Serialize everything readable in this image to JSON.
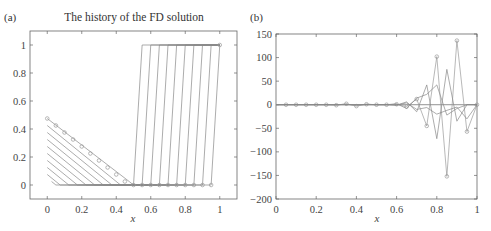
{
  "chart_data": [
    {
      "panel": "(a)",
      "type": "line",
      "title": "The history of the FD solution",
      "xlabel": "x",
      "ylabel": "",
      "xlim": [
        -0.1,
        1.1
      ],
      "ylim": [
        -0.1,
        1.1
      ],
      "xticks": [
        0,
        0.2,
        0.4,
        0.6,
        0.8,
        1
      ],
      "xtick_labels": [
        "0",
        "0.2",
        "0.4",
        "0.6",
        "0.8",
        "1"
      ],
      "yticks": [
        0,
        0.2,
        0.4,
        0.6,
        0.8,
        1
      ],
      "ytick_labels": [
        "0",
        "0.2",
        "0.4",
        "0.6",
        "0.8",
        "1"
      ],
      "grid": false,
      "description": "Ten time levels of a finite-difference solution; a triangular profile decaying from ~0.475 at x=0 to 0 at x=0.5, and a step from 0 to 1 moving left from x=0.95 to x=0.5",
      "series": [
        {
          "name": "step-1",
          "x": [
            0,
            0.475,
            0.5,
            0.95,
            1.0
          ],
          "y": [
            0.475,
            0.025,
            0,
            0,
            1
          ]
        },
        {
          "name": "step-2",
          "x": [
            0,
            0.425,
            0.5,
            0.9,
            0.95,
            1.0
          ],
          "y": [
            0.425,
            0,
            0,
            0,
            1,
            1
          ]
        },
        {
          "name": "step-3",
          "x": [
            0,
            0.375,
            0.5,
            0.85,
            0.9,
            1.0
          ],
          "y": [
            0.375,
            0,
            0,
            0,
            1,
            1
          ]
        },
        {
          "name": "step-4",
          "x": [
            0,
            0.325,
            0.5,
            0.8,
            0.85,
            1.0
          ],
          "y": [
            0.325,
            0,
            0,
            0,
            1,
            1
          ]
        },
        {
          "name": "step-5",
          "x": [
            0,
            0.275,
            0.5,
            0.75,
            0.8,
            1.0
          ],
          "y": [
            0.275,
            0,
            0,
            0,
            1,
            1
          ]
        },
        {
          "name": "step-6",
          "x": [
            0,
            0.225,
            0.5,
            0.7,
            0.75,
            1.0
          ],
          "y": [
            0.225,
            0,
            0,
            0,
            1,
            1
          ]
        },
        {
          "name": "step-7",
          "x": [
            0,
            0.175,
            0.5,
            0.65,
            0.7,
            1.0
          ],
          "y": [
            0.175,
            0,
            0,
            0,
            1,
            1
          ]
        },
        {
          "name": "step-8",
          "x": [
            0,
            0.125,
            0.5,
            0.6,
            0.65,
            1.0
          ],
          "y": [
            0.125,
            0,
            0,
            0,
            1,
            1
          ]
        },
        {
          "name": "step-9",
          "x": [
            0,
            0.075,
            0.5,
            0.55,
            0.6,
            1.0
          ],
          "y": [
            0.075,
            0,
            0,
            0,
            1,
            1
          ]
        },
        {
          "name": "step-10",
          "x": [
            0.025,
            0.05,
            0.5,
            0.55,
            1.0
          ],
          "y": [
            0.025,
            0,
            0,
            1,
            1
          ]
        }
      ],
      "markers": {
        "top_line_x": [
          0,
          0.05,
          0.1,
          0.15,
          0.2,
          0.25,
          0.3,
          0.35,
          0.4,
          0.45
        ],
        "top_line_y": [
          0.475,
          0.425,
          0.375,
          0.325,
          0.275,
          0.225,
          0.175,
          0.125,
          0.075,
          0.025
        ],
        "bottom_x": [
          0.5,
          0.55,
          0.6,
          0.65,
          0.7,
          0.75,
          0.8,
          0.85,
          0.9,
          0.95
        ],
        "bottom_y": [
          0,
          0,
          0,
          0,
          0,
          0,
          0,
          0,
          0,
          0
        ],
        "corner": [
          1,
          1
        ]
      }
    },
    {
      "panel": "(b)",
      "type": "line",
      "title": "",
      "xlabel": "x",
      "ylabel": "",
      "xlim": [
        0,
        1
      ],
      "ylim": [
        -200,
        150
      ],
      "xticks": [
        0,
        0.2,
        0.4,
        0.6,
        0.8,
        1
      ],
      "xtick_labels": [
        "0",
        "0.2",
        "0.4",
        "0.6",
        "0.8",
        "1"
      ],
      "yticks": [
        150,
        100,
        50,
        0,
        -50,
        -100,
        -150,
        -200
      ],
      "ytick_labels": [
        "150",
        "100",
        "50",
        "0",
        "−50",
        "−100",
        "−150",
        "−200"
      ],
      "grid": false,
      "description": "Unstable oscillating FD solution; amplitude grows toward x=1",
      "x": [
        0,
        0.05,
        0.1,
        0.15,
        0.2,
        0.25,
        0.3,
        0.35,
        0.4,
        0.45,
        0.5,
        0.55,
        0.6,
        0.65,
        0.7,
        0.75,
        0.8,
        0.85,
        0.9,
        0.95,
        1.0
      ],
      "series": [
        {
          "name": "final (marked)",
          "values": [
            0,
            0,
            0,
            0,
            0,
            0,
            -1,
            2,
            -3,
            1,
            0,
            0,
            1,
            -4,
            12,
            -45,
            102,
            -152,
            136,
            -57,
            0
          ]
        },
        {
          "name": "level-2",
          "values": [
            0,
            0,
            0,
            0,
            0,
            0,
            0,
            1,
            -1,
            1,
            0,
            0,
            -1,
            6,
            -15,
            42,
            -72,
            75,
            -35,
            0,
            0
          ]
        },
        {
          "name": "level-3",
          "values": [
            0,
            0,
            0,
            0,
            0,
            0,
            0,
            0,
            0,
            0,
            0,
            0,
            2,
            -8,
            14,
            22,
            42,
            -22,
            -8,
            0,
            0
          ]
        },
        {
          "name": "level-4",
          "values": [
            0,
            0,
            0,
            0,
            0,
            0,
            0,
            0,
            0,
            0,
            0,
            0,
            -1,
            4,
            -10,
            -6,
            -20,
            -12,
            -5,
            -30,
            0
          ]
        }
      ]
    }
  ]
}
